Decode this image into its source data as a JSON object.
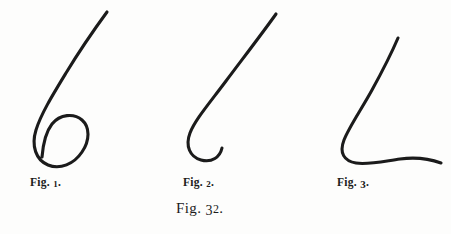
{
  "plate": {
    "background_color": "#fdfdfc",
    "ink_color": "#1b1b1b",
    "caption": {
      "word": "Fig.",
      "number": "32",
      "period": ".",
      "full_text": "Fig. 32."
    }
  },
  "figures": [
    {
      "id": "fig-1",
      "caption_word": "Fig.",
      "caption_number": "1",
      "caption_period": ".",
      "caption_full": "Fig. 1.",
      "shape_name": "six-shaped-looping-curve",
      "stroke_color": "#1b1b1b",
      "stroke_width": 3.1,
      "path": "M 107 12 C 96 27, 80 50, 66 73 C 52 96, 41 114, 36 130 C 31 146, 36 160, 48 165 C 60 170, 74 164, 82 152 C 90 140, 90 127, 82 120 C 74 113, 60 114, 52 124 C 45 133, 43 145, 42 157"
    },
    {
      "id": "fig-2",
      "caption_word": "Fig.",
      "caption_number": "2",
      "caption_period": ".",
      "caption_full": "Fig. 2.",
      "shape_name": "hooked-j-curve",
      "stroke_color": "#1b1b1b",
      "stroke_width": 3.1,
      "path": "M 276 14 C 264 31, 244 57, 226 81 C 208 105, 195 120, 190 133 C 185 146, 190 157, 201 160 C 212 163, 220 157, 222 148"
    },
    {
      "id": "fig-3",
      "caption_word": "Fig.",
      "caption_number": "3",
      "caption_period": ".",
      "caption_full": "Fig. 3.",
      "shape_name": "l-shaped-curve-with-sweeping-base",
      "stroke_color": "#1b1b1b",
      "stroke_width": 3.1,
      "path": "M 398 38 C 392 52, 383 70, 372 90 C 361 110, 349 127, 344 140 C 339 153, 344 161, 356 163 C 368 165, 385 161, 400 159 C 415 157, 430 159, 441 163"
    }
  ]
}
